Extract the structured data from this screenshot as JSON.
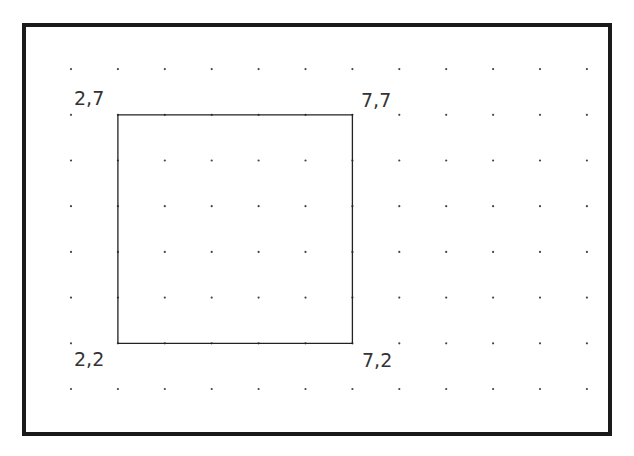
{
  "diagram": {
    "type": "dot-grid-coordinate-plot",
    "grid": {
      "x_range": [
        1,
        12
      ],
      "y_range": [
        1,
        8
      ],
      "dot_color": "#444444",
      "origin_px": {
        "x": 71,
        "y": 389
      },
      "step_px": {
        "x": 46.9,
        "y": 45.7
      }
    },
    "frame_color": "#1a1a1a",
    "square": {
      "stroke": "#222222",
      "vertices": [
        {
          "x": 2,
          "y": 7,
          "label": "2,7"
        },
        {
          "x": 7,
          "y": 7,
          "label": "7,7"
        },
        {
          "x": 7,
          "y": 2,
          "label": "7,2"
        },
        {
          "x": 2,
          "y": 2,
          "label": "2,2"
        }
      ]
    },
    "labels": {
      "top_left": "2,7",
      "top_right": "7,7",
      "bottom_right": "7,2",
      "bottom_left": "2,2"
    }
  }
}
